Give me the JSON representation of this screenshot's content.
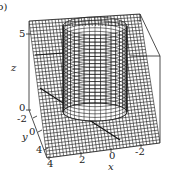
{
  "panel_label": "b)",
  "chart_data": {
    "type": "surface3d",
    "title": "",
    "xlabel": "x",
    "ylabel": "y",
    "zlabel": "z",
    "x_ticks": [
      "4",
      "2",
      "0",
      "-2"
    ],
    "y_ticks": [
      "-2",
      "0",
      "4"
    ],
    "z_ticks": [
      "0",
      "5"
    ],
    "xlim": [
      -3,
      4
    ],
    "ylim": [
      -3,
      4
    ],
    "zlim": [
      0,
      5.5
    ],
    "surfaces": [
      {
        "name": "plane",
        "kind": "mesh",
        "z": 0
      },
      {
        "name": "cylinder",
        "kind": "mesh",
        "radius": 2,
        "z_range": [
          0,
          5
        ]
      }
    ],
    "grid": false,
    "box": true
  },
  "colors": {
    "line": "#1a1a1a",
    "background": "#ffffff"
  }
}
